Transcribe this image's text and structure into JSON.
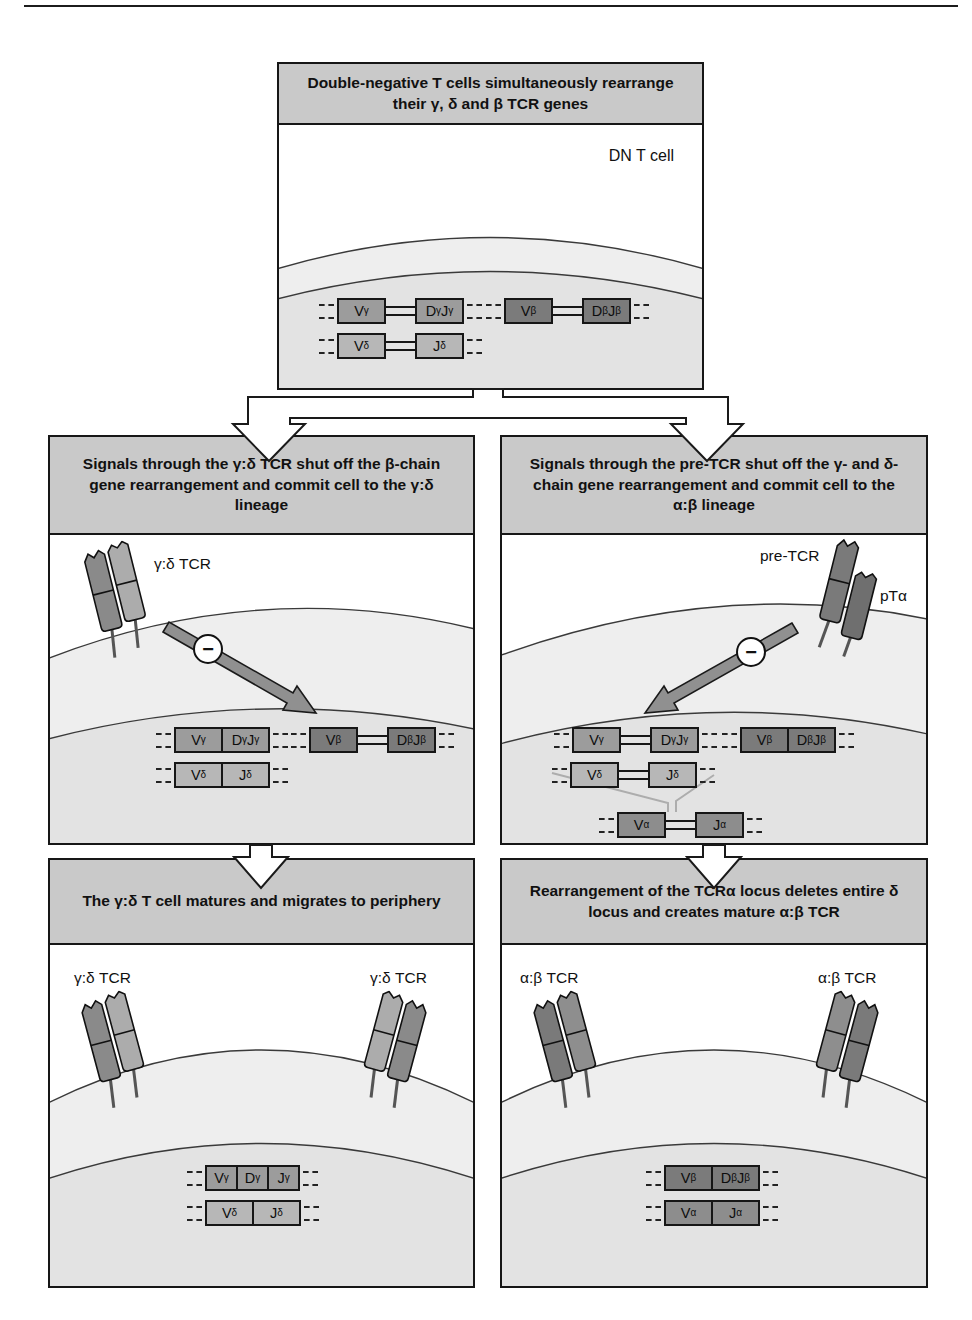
{
  "panels": {
    "dn": {
      "header": "Double-negative T cells simultaneously rearrange their γ, δ and β TCR genes",
      "cell_label": "DN T cell",
      "rows": {
        "gamma": [
          "V_γ",
          "D_γJ_γ"
        ],
        "delta": [
          "V_δ",
          "J_δ"
        ],
        "beta": [
          "V_β",
          "D_βJ_β"
        ]
      }
    },
    "mid_left": {
      "header": "Signals through the γ:δ TCR shut off the β-chain gene rearrangement and commit cell to the γ:δ lineage",
      "receptor_label": "γ:δ TCR",
      "inhibit_sign": "−",
      "rows": {
        "gamma": [
          "V_γ",
          "D_γJ_γ"
        ],
        "delta": [
          "V_δ",
          "J_δ"
        ],
        "beta": [
          "V_β",
          "D_βJ_β"
        ]
      }
    },
    "mid_right": {
      "header": "Signals through the pre-TCR shut off the γ- and δ-chain gene rearrangement and commit cell to the α:β lineage",
      "receptor_label": "pre-TCR",
      "pt_alpha_label": "pTα",
      "inhibit_sign": "−",
      "rows": {
        "gamma": [
          "V_γ",
          "D_γJ_γ"
        ],
        "beta": [
          "V_β",
          "D_βJ_β"
        ],
        "delta": [
          "V_δ",
          "J_δ"
        ],
        "alpha": [
          "V_α",
          "J_α"
        ]
      }
    },
    "bottom_left": {
      "header": "The γ:δ T cell matures and migrates to periphery",
      "receptor_label_left": "γ:δ TCR",
      "receptor_label_right": "γ:δ TCR",
      "rows": {
        "gamma": [
          "V_γ",
          "D_γ",
          "J_γ"
        ],
        "delta": [
          "V_δ",
          "J_δ"
        ]
      }
    },
    "bottom_right": {
      "header": "Rearrangement of the TCRα locus deletes entire δ locus and creates mature α:β TCR",
      "receptor_label_left": "α:β TCR",
      "receptor_label_right": "α:β TCR",
      "rows": {
        "beta": [
          "V_β",
          "D_βJ_β"
        ],
        "alpha": [
          "V_α",
          "J_α"
        ]
      }
    }
  },
  "colors": {
    "panel_header_bg": "#c9c9c9",
    "cytoplasm": "#eeeeee",
    "nucleus": "#e3e3e3",
    "gene_gamma": "#9c9c9c",
    "gene_delta": "#b7b7b7",
    "gene_beta": "#7b7b7b",
    "gene_alpha": "#8d8d8d",
    "signal_arrow": "#909090"
  }
}
